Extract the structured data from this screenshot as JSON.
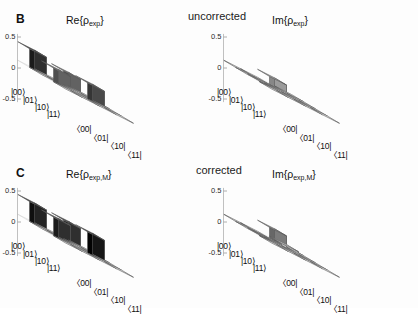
{
  "figure": {
    "width": 418,
    "height": 308,
    "background": "#fdfdfd"
  },
  "panels": [
    {
      "letter": "B",
      "condition": "uncorrected",
      "subplots": [
        {
          "title_prefix": "Re{ρ",
          "title_sub": "exp",
          "title_suffix": "}",
          "part": "real"
        },
        {
          "title_prefix": "Im{ρ",
          "title_sub": "exp",
          "title_suffix": "}",
          "part": "imag"
        }
      ]
    },
    {
      "letter": "C",
      "condition": "corrected",
      "subplots": [
        {
          "title_prefix": "Re{ρ",
          "title_sub": "exp,M",
          "title_suffix": "}",
          "part": "real"
        },
        {
          "title_prefix": "Im{ρ",
          "title_sub": "exp,M",
          "title_suffix": "}",
          "part": "imag"
        }
      ]
    }
  ],
  "axes": {
    "z_ticks": [
      "0.5",
      "0",
      "-0.5"
    ],
    "z_values": [
      0.5,
      0,
      -0.5
    ],
    "row_labels": [
      "|00⟩",
      "|01⟩",
      "|10⟩",
      "|11⟩"
    ],
    "col_labels": [
      "〈00|",
      "〈01|",
      "〈10|",
      "〈11|"
    ]
  },
  "chart_data": [
    {
      "type": "bar",
      "title": "Re{ρexp}",
      "panel": "B",
      "condition": "uncorrected",
      "part": "real",
      "categories_rows": [
        "|00⟩",
        "|01⟩",
        "|10⟩",
        "|11⟩"
      ],
      "categories_cols": [
        "〈00|",
        "〈01|",
        "〈10|",
        "〈11|"
      ],
      "zlim": [
        -0.5,
        0.5
      ],
      "grid": true,
      "values": [
        [
          0.3,
          0.02,
          0.22,
          0.01
        ],
        [
          0.02,
          0.03,
          0.02,
          0.01
        ],
        [
          0.22,
          0.02,
          0.26,
          0.02
        ],
        [
          0.01,
          0.01,
          0.02,
          0.01
        ]
      ]
    },
    {
      "type": "bar",
      "title": "Im{ρexp}",
      "panel": "B",
      "condition": "uncorrected",
      "part": "imag",
      "categories_rows": [
        "|00⟩",
        "|01⟩",
        "|10⟩",
        "|11⟩"
      ],
      "categories_cols": [
        "〈00|",
        "〈01|",
        "〈10|",
        "〈11|"
      ],
      "zlim": [
        -0.5,
        0.5
      ],
      "grid": true,
      "values": [
        [
          0.01,
          0.02,
          0.13,
          0.01
        ],
        [
          0.02,
          0.01,
          0.03,
          0.0
        ],
        [
          -0.13,
          0.02,
          0.02,
          0.01
        ],
        [
          0.01,
          0.0,
          0.01,
          0.0
        ]
      ]
    },
    {
      "type": "bar",
      "title": "Re{ρexp,M}",
      "panel": "C",
      "condition": "corrected",
      "part": "real",
      "categories_rows": [
        "|00⟩",
        "|01⟩",
        "|10⟩",
        "|11⟩"
      ],
      "categories_cols": [
        "〈00|",
        "〈01|",
        "〈10|",
        "〈11|"
      ],
      "zlim": [
        -0.5,
        0.5
      ],
      "grid": true,
      "values": [
        [
          0.32,
          0.02,
          0.3,
          0.01
        ],
        [
          0.02,
          0.02,
          0.02,
          0.01
        ],
        [
          0.3,
          0.02,
          0.34,
          0.02
        ],
        [
          0.01,
          0.01,
          0.02,
          0.01
        ]
      ]
    },
    {
      "type": "bar",
      "title": "Im{ρexp,M}",
      "panel": "C",
      "condition": "corrected",
      "part": "imag",
      "categories_rows": [
        "|00⟩",
        "|01⟩",
        "|10⟩",
        "|11⟩"
      ],
      "categories_cols": [
        "〈00|",
        "〈01|",
        "〈10|",
        "〈11|"
      ],
      "zlim": [
        -0.5,
        0.5
      ],
      "grid": true,
      "values": [
        [
          0.01,
          0.03,
          0.18,
          0.01
        ],
        [
          0.02,
          0.02,
          0.04,
          0.0
        ],
        [
          -0.18,
          0.03,
          0.02,
          0.01
        ],
        [
          0.01,
          0.0,
          0.01,
          0.0
        ]
      ]
    }
  ]
}
